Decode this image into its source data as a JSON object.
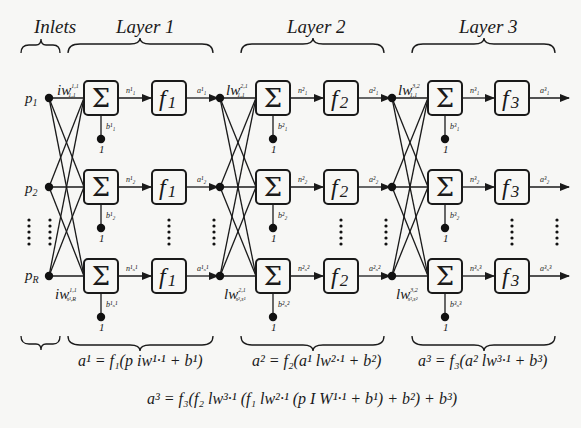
{
  "headers": {
    "inlets": "Inlets",
    "layer1": "Layer 1",
    "layer2": "Layer 2",
    "layer3": "Layer 3"
  },
  "inputs": {
    "p1": "p",
    "p1_sub": "1",
    "p2": "p",
    "p2_sub": "2",
    "pR": "p",
    "pR_sub": "R"
  },
  "weights": {
    "iw_top": "iw",
    "iw_top_sup": "1,1",
    "iw_top_sub": "1,1",
    "iw_bot": "iw",
    "iw_bot_sup": "1,1",
    "iw_bot_sub": "s¹,R",
    "lw2_top": "lw",
    "lw2_top_sup": "2,1",
    "lw2_top_sub": "1,1",
    "lw2_bot": "lw",
    "lw2_bot_sup": "2,1",
    "lw2_bot_sub": "s²,s¹",
    "lw3_top": "lw",
    "lw3_top_sup": "3,2",
    "lw3_top_sub": "1,1",
    "lw3_bot": "lw",
    "lw3_bot_sup": "3,2",
    "lw3_bot_sub": "s³,s²"
  },
  "nodes": {
    "sigma": "Σ",
    "one": "1",
    "f1": "f",
    "f1_sub": "1",
    "f2": "f",
    "f2_sub": "2",
    "f3": "f",
    "f3_sub": "3"
  },
  "signals": {
    "layer1": {
      "n": [
        "n¹₁",
        "n¹₂",
        "n¹ₛ¹"
      ],
      "a": [
        "a¹₁",
        "a¹₂",
        "a¹ₛ¹"
      ],
      "b": [
        "b¹₁",
        "b¹₂",
        "b¹ₛ¹"
      ]
    },
    "layer2": {
      "n": [
        "n²₁",
        "n²₂",
        "n²ₛ²"
      ],
      "a": [
        "a²₁",
        "a²₂",
        "a²ₛ²"
      ],
      "b": [
        "b²₁",
        "b²₂",
        "b²ₛ²"
      ]
    },
    "layer3": {
      "n": [
        "n³₁",
        "n³₂",
        "n³ₛ³"
      ],
      "a": [
        "a³₁",
        "a³₂",
        "a³ₛ³"
      ],
      "b": [
        "b³₁",
        "b³₂",
        "b³ₛ³"
      ]
    }
  },
  "equations": {
    "layer1": "a¹ = f₁(p iw¹·¹ + b¹)",
    "layer2": "a² = f₂(a¹ lw²·¹ + b²)",
    "layer3": "a³ = f₃(a² lw³·¹ + b³)",
    "full": "a³ = f₃(f₂ lw³·¹ (f₁ lw²·¹ (p I W¹·¹ + b¹) + b²) + b³)"
  }
}
